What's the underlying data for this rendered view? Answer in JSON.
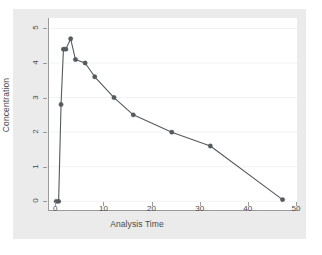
{
  "chart_data": {
    "type": "line",
    "title": "",
    "subtitle": "",
    "xlabel": "Analysis Time",
    "ylabel": "Concentration",
    "xlim": [
      -1.5,
      50
    ],
    "ylim": [
      -0.25,
      5.3
    ],
    "xticks": [
      0,
      10,
      20,
      30,
      40,
      50
    ],
    "xtick_labels": [
      "0",
      "10",
      "20",
      "30",
      "40",
      "50"
    ],
    "yticks": [
      0,
      1,
      2,
      3,
      4,
      5
    ],
    "ytick_labels": [
      "0",
      "1",
      "2",
      "3",
      "4",
      "5"
    ],
    "grid": "horizontal",
    "legend": "none",
    "marker": "filled-circle",
    "x": [
      0,
      0.5,
      1,
      1.5,
      2,
      3,
      4,
      6,
      8,
      12,
      16,
      24,
      32,
      47
    ],
    "y": [
      0,
      0,
      2.8,
      4.4,
      4.4,
      4.7,
      4.1,
      4.0,
      3.6,
      3.0,
      2.5,
      2.0,
      1.6,
      0.05
    ],
    "series": [
      {
        "name": "Concentration",
        "color": "#555a60",
        "values": [
          0,
          0,
          2.8,
          4.4,
          4.4,
          4.7,
          4.1,
          4.0,
          3.6,
          3.0,
          2.5,
          2.0,
          1.6,
          0.05
        ]
      }
    ],
    "annotations": []
  },
  "colors": {
    "canvas": "#ebebeb",
    "plot_background": "#ffffff",
    "axis": "#9a9a9a",
    "gridline": "#f2f2f2",
    "line": "#555a60",
    "marker": "#555a60",
    "tick_text": "#4a4a4a"
  }
}
